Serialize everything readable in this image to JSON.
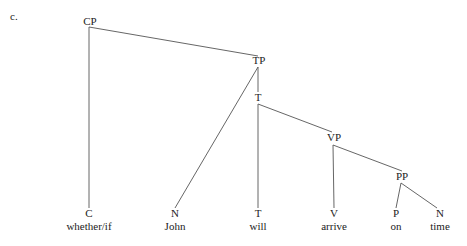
{
  "example_label": "c.",
  "tree": {
    "nodes": {
      "CP": {
        "label": "CP"
      },
      "TP": {
        "label": "TP"
      },
      "Tbar": {
        "label": "T"
      },
      "VP": {
        "label": "VP"
      },
      "PP": {
        "label": "PP"
      },
      "C": {
        "label": "C",
        "word": "whether/if"
      },
      "N1": {
        "label": "N",
        "word": "John"
      },
      "T": {
        "label": "T",
        "word": "will"
      },
      "V": {
        "label": "V",
        "word": "arrive"
      },
      "P": {
        "label": "P",
        "word": "on"
      },
      "N2": {
        "label": "N",
        "word": "time"
      }
    },
    "edges": [
      [
        "CP",
        "C"
      ],
      [
        "CP",
        "TP"
      ],
      [
        "TP",
        "N1"
      ],
      [
        "TP",
        "Tbar"
      ],
      [
        "Tbar",
        "T"
      ],
      [
        "Tbar",
        "VP"
      ],
      [
        "VP",
        "V"
      ],
      [
        "VP",
        "PP"
      ],
      [
        "PP",
        "P"
      ],
      [
        "PP",
        "N2"
      ]
    ]
  }
}
